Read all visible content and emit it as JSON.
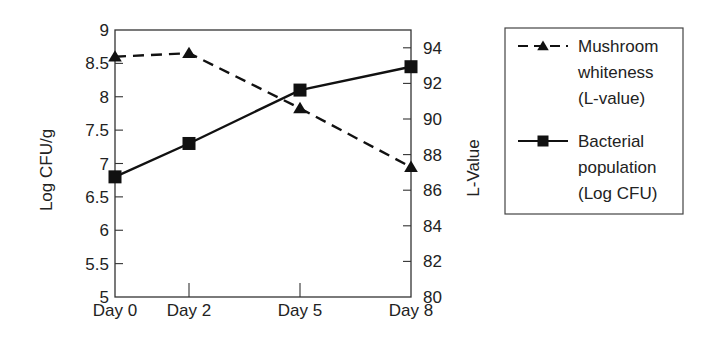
{
  "chart_data": {
    "type": "line",
    "title": "",
    "categories": [
      "Day 0",
      "Day 2",
      "Day 5",
      "Day 8"
    ],
    "xlabel": "",
    "ylabel_left": "Log CFU/g",
    "ylabel_right": "L-Value",
    "ylim_left": [
      5,
      9
    ],
    "yticks_left": [
      "5",
      "5.5",
      "6",
      "6.5",
      "7",
      "7.5",
      "8",
      "8.5",
      "9"
    ],
    "ylim_right": [
      80,
      95
    ],
    "yticks_right": [
      "80",
      "82",
      "84",
      "86",
      "88",
      "90",
      "92",
      "94"
    ],
    "grid": false,
    "legend_position": "right",
    "series": [
      {
        "name": "Mushroom whiteness (L-value)",
        "legend_lines": [
          "Mushroom",
          "whiteness",
          "(L-value)"
        ],
        "axis": "right",
        "marker": "triangle",
        "line_style": "dashed",
        "color": "#111111",
        "values": [
          93.5,
          93.7,
          90.6,
          87.3
        ]
      },
      {
        "name": "Bacterial population (Log CFU)",
        "legend_lines": [
          "Bacterial",
          "population",
          "(Log CFU)"
        ],
        "axis": "left",
        "marker": "square",
        "line_style": "solid",
        "color": "#111111",
        "values": [
          6.8,
          7.3,
          8.1,
          8.45
        ]
      }
    ]
  }
}
